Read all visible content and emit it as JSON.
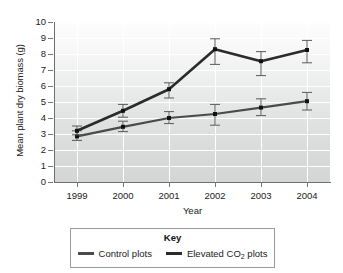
{
  "chart_data": {
    "type": "line",
    "title": "",
    "xlabel": "Year",
    "ylabel": "Mean plant dry biomass (g)",
    "categories": [
      "1999",
      "2000",
      "2001",
      "2002",
      "2003",
      "2004"
    ],
    "x": [
      1999,
      2000,
      2001,
      2002,
      2003,
      2004
    ],
    "xlim": [
      1998.6,
      2004.4
    ],
    "ylim": [
      0,
      10
    ],
    "ytick_labels": [
      "0",
      "1",
      "2",
      "3",
      "4",
      "5",
      "6",
      "7",
      "8",
      "9",
      "10"
    ],
    "yticks": [
      0,
      1,
      2,
      3,
      4,
      5,
      6,
      7,
      8,
      9,
      10
    ],
    "grid": "horizontal-and-vertical-white-gridlines",
    "legend_position": "below-plot",
    "legend_title": "Key",
    "series": [
      {
        "name": "Control plots",
        "color": "#4a4a4a",
        "values": [
          2.85,
          3.45,
          4.0,
          4.25,
          4.65,
          5.05
        ],
        "error_upper": [
          3.2,
          3.8,
          4.4,
          4.85,
          5.2,
          5.6
        ],
        "error_lower": [
          2.6,
          3.15,
          3.65,
          3.55,
          4.15,
          4.5
        ]
      },
      {
        "name": "Elevated CO2 plots",
        "color": "#2b2b2b",
        "values": [
          3.2,
          4.45,
          5.8,
          8.3,
          7.55,
          8.25
        ],
        "error_upper": [
          3.5,
          4.85,
          6.2,
          8.95,
          8.15,
          8.85
        ],
        "error_lower": [
          2.95,
          4.05,
          5.25,
          7.35,
          6.65,
          7.45
        ]
      }
    ]
  },
  "legend": {
    "title": "Key",
    "items": [
      {
        "label": "Control plots",
        "label_prefix": "Control plots",
        "sub": "",
        "label_suffix": ""
      },
      {
        "label": "Elevated CO2 plots",
        "label_prefix": "Elevated CO",
        "sub": "2",
        "label_suffix": " plots"
      }
    ]
  },
  "colors": {
    "control": "#4a4a4a",
    "elevated": "#2b2b2b",
    "grid": "#ffffff",
    "axis": "#6f6f6f",
    "plot_bg_top": "#fdfdfd",
    "plot_bg_bottom": "#d4d5d5"
  }
}
